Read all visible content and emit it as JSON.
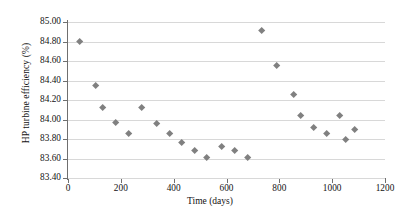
{
  "chart_data": {
    "type": "scatter",
    "title": "",
    "xlabel": "Time (days)",
    "ylabel": "HP turbine efficiency (%)",
    "xlim": [
      0,
      1200
    ],
    "ylim": [
      83.4,
      85.0
    ],
    "xticks": [
      "0",
      "200",
      "400",
      "600",
      "800",
      "1000",
      "1200"
    ],
    "xtick_values": [
      0,
      200,
      400,
      600,
      800,
      1000,
      1200
    ],
    "yticks": [
      "83.40",
      "83.60",
      "83.80",
      "84.00",
      "84.20",
      "84.40",
      "84.60",
      "84.80",
      "85.00"
    ],
    "ytick_values": [
      83.4,
      83.6,
      83.8,
      84.0,
      84.2,
      84.4,
      84.6,
      84.8,
      85.0
    ],
    "grid": true,
    "grid_axis": "y",
    "legend": false,
    "marker": "diamond",
    "marker_color": "#808080",
    "series": [
      {
        "name": "HP turbine efficiency",
        "points": [
          {
            "x": 45,
            "y": 84.8
          },
          {
            "x": 105,
            "y": 84.35
          },
          {
            "x": 130,
            "y": 84.12
          },
          {
            "x": 180,
            "y": 83.97
          },
          {
            "x": 230,
            "y": 83.85
          },
          {
            "x": 280,
            "y": 84.12
          },
          {
            "x": 335,
            "y": 83.96
          },
          {
            "x": 385,
            "y": 83.85
          },
          {
            "x": 430,
            "y": 83.76
          },
          {
            "x": 480,
            "y": 83.68
          },
          {
            "x": 525,
            "y": 83.61
          },
          {
            "x": 580,
            "y": 83.72
          },
          {
            "x": 630,
            "y": 83.68
          },
          {
            "x": 680,
            "y": 83.61
          },
          {
            "x": 735,
            "y": 84.91
          },
          {
            "x": 790,
            "y": 84.55
          },
          {
            "x": 855,
            "y": 84.25
          },
          {
            "x": 880,
            "y": 84.04
          },
          {
            "x": 930,
            "y": 83.92
          },
          {
            "x": 980,
            "y": 83.85
          },
          {
            "x": 1030,
            "y": 84.04
          },
          {
            "x": 1050,
            "y": 83.79
          },
          {
            "x": 1085,
            "y": 83.9
          }
        ]
      }
    ]
  }
}
